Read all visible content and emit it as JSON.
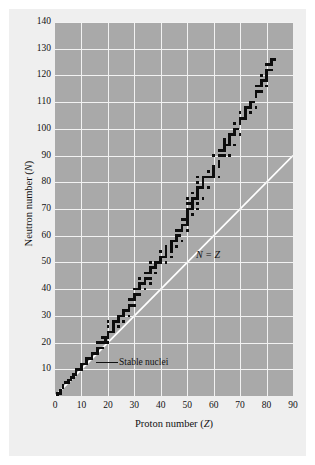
{
  "figure": {
    "background_color": "#efefef",
    "plot_background_color": "#a9a9a9",
    "grid_color": "#f2f2f2",
    "marker_color": "#0d0d0d",
    "reference_line_color": "#ffffff"
  },
  "axes": {
    "x_title_prefix": "Proton number (",
    "x_title_symbol": "Z",
    "x_title_suffix": ")",
    "y_title_prefix": "Neutron number (",
    "y_title_symbol": "N",
    "y_title_suffix": ")",
    "x_ticks": [
      "0",
      "10",
      "20",
      "30",
      "40",
      "50",
      "60",
      "70",
      "80",
      "90"
    ],
    "y_ticks": [
      "10",
      "20",
      "30",
      "40",
      "50",
      "60",
      "70",
      "80",
      "90",
      "100",
      "110",
      "120",
      "130",
      "140"
    ]
  },
  "annotations": {
    "nz_line_label": "N = Z",
    "stable_nuclei_label": "Stable nuclei"
  },
  "chart_data": {
    "type": "scatter",
    "title": "",
    "subtitle": "",
    "xlabel": "Proton number (Z)",
    "ylabel": "Neutron number (N)",
    "xlim": [
      0,
      90
    ],
    "ylim": [
      0,
      140
    ],
    "xticks": [
      0,
      10,
      20,
      30,
      40,
      50,
      60,
      70,
      80,
      90
    ],
    "yticks": [
      0,
      10,
      20,
      30,
      40,
      50,
      60,
      70,
      80,
      90,
      100,
      110,
      120,
      130,
      140
    ],
    "grid": true,
    "legend": "none",
    "annotations": [
      {
        "text": "N = Z",
        "x": 57,
        "y": 49
      },
      {
        "text": "Stable nuclei",
        "x": 24,
        "y": 14
      }
    ],
    "reference_lines": [
      {
        "name": "N = Z",
        "type": "line",
        "color": "#ffffff",
        "points": [
          [
            0,
            0
          ],
          [
            90,
            90
          ]
        ]
      }
    ],
    "series": [
      {
        "name": "Stable nuclei",
        "marker": "square",
        "color": "#0d0d0d",
        "description": "Z (proton number) and N (neutron number) of the stable nuclides (band of stability)",
        "points": [
          [
            1,
            0
          ],
          [
            1,
            1
          ],
          [
            2,
            1
          ],
          [
            2,
            2
          ],
          [
            3,
            3
          ],
          [
            3,
            4
          ],
          [
            4,
            5
          ],
          [
            5,
            5
          ],
          [
            5,
            6
          ],
          [
            6,
            6
          ],
          [
            6,
            7
          ],
          [
            7,
            7
          ],
          [
            7,
            8
          ],
          [
            8,
            8
          ],
          [
            8,
            9
          ],
          [
            8,
            10
          ],
          [
            9,
            10
          ],
          [
            10,
            10
          ],
          [
            10,
            11
          ],
          [
            10,
            12
          ],
          [
            11,
            12
          ],
          [
            12,
            12
          ],
          [
            12,
            13
          ],
          [
            12,
            14
          ],
          [
            13,
            14
          ],
          [
            14,
            14
          ],
          [
            14,
            15
          ],
          [
            14,
            16
          ],
          [
            15,
            16
          ],
          [
            16,
            16
          ],
          [
            16,
            17
          ],
          [
            16,
            18
          ],
          [
            16,
            20
          ],
          [
            17,
            18
          ],
          [
            17,
            20
          ],
          [
            18,
            18
          ],
          [
            18,
            20
          ],
          [
            18,
            22
          ],
          [
            19,
            20
          ],
          [
            19,
            21
          ],
          [
            19,
            22
          ],
          [
            20,
            20
          ],
          [
            20,
            22
          ],
          [
            20,
            23
          ],
          [
            20,
            24
          ],
          [
            20,
            26
          ],
          [
            20,
            28
          ],
          [
            21,
            24
          ],
          [
            22,
            24
          ],
          [
            22,
            25
          ],
          [
            22,
            26
          ],
          [
            22,
            27
          ],
          [
            22,
            28
          ],
          [
            23,
            28
          ],
          [
            24,
            26
          ],
          [
            24,
            28
          ],
          [
            24,
            29
          ],
          [
            24,
            30
          ],
          [
            25,
            30
          ],
          [
            26,
            28
          ],
          [
            26,
            30
          ],
          [
            26,
            31
          ],
          [
            26,
            32
          ],
          [
            27,
            32
          ],
          [
            28,
            30
          ],
          [
            28,
            32
          ],
          [
            28,
            33
          ],
          [
            28,
            34
          ],
          [
            28,
            36
          ],
          [
            29,
            34
          ],
          [
            29,
            36
          ],
          [
            30,
            34
          ],
          [
            30,
            36
          ],
          [
            30,
            37
          ],
          [
            30,
            38
          ],
          [
            30,
            40
          ],
          [
            31,
            38
          ],
          [
            31,
            40
          ],
          [
            32,
            38
          ],
          [
            32,
            40
          ],
          [
            32,
            41
          ],
          [
            32,
            42
          ],
          [
            32,
            44
          ],
          [
            33,
            42
          ],
          [
            34,
            40
          ],
          [
            34,
            42
          ],
          [
            34,
            43
          ],
          [
            34,
            44
          ],
          [
            34,
            46
          ],
          [
            35,
            44
          ],
          [
            35,
            46
          ],
          [
            36,
            42
          ],
          [
            36,
            44
          ],
          [
            36,
            46
          ],
          [
            36,
            47
          ],
          [
            36,
            48
          ],
          [
            36,
            50
          ],
          [
            37,
            48
          ],
          [
            38,
            46
          ],
          [
            38,
            48
          ],
          [
            38,
            49
          ],
          [
            38,
            50
          ],
          [
            39,
            50
          ],
          [
            40,
            50
          ],
          [
            40,
            51
          ],
          [
            40,
            52
          ],
          [
            40,
            54
          ],
          [
            41,
            52
          ],
          [
            42,
            50
          ],
          [
            42,
            52
          ],
          [
            42,
            53
          ],
          [
            42,
            54
          ],
          [
            42,
            55
          ],
          [
            42,
            56
          ],
          [
            44,
            52
          ],
          [
            44,
            54
          ],
          [
            44,
            55
          ],
          [
            44,
            56
          ],
          [
            44,
            57
          ],
          [
            44,
            58
          ],
          [
            45,
            58
          ],
          [
            46,
            56
          ],
          [
            46,
            58
          ],
          [
            46,
            59
          ],
          [
            46,
            60
          ],
          [
            46,
            62
          ],
          [
            47,
            60
          ],
          [
            47,
            62
          ],
          [
            48,
            58
          ],
          [
            48,
            62
          ],
          [
            48,
            63
          ],
          [
            48,
            64
          ],
          [
            48,
            66
          ],
          [
            49,
            64
          ],
          [
            49,
            66
          ],
          [
            50,
            62
          ],
          [
            50,
            64
          ],
          [
            50,
            65
          ],
          [
            50,
            66
          ],
          [
            50,
            67
          ],
          [
            50,
            68
          ],
          [
            50,
            69
          ],
          [
            50,
            70
          ],
          [
            50,
            72
          ],
          [
            50,
            74
          ],
          [
            51,
            70
          ],
          [
            51,
            72
          ],
          [
            52,
            68
          ],
          [
            52,
            70
          ],
          [
            52,
            71
          ],
          [
            52,
            72
          ],
          [
            52,
            73
          ],
          [
            52,
            74
          ],
          [
            52,
            76
          ],
          [
            53,
            74
          ],
          [
            54,
            70
          ],
          [
            54,
            72
          ],
          [
            54,
            74
          ],
          [
            54,
            75
          ],
          [
            54,
            76
          ],
          [
            54,
            77
          ],
          [
            54,
            78
          ],
          [
            54,
            80
          ],
          [
            54,
            82
          ],
          [
            55,
            78
          ],
          [
            56,
            74
          ],
          [
            56,
            78
          ],
          [
            56,
            79
          ],
          [
            56,
            80
          ],
          [
            56,
            81
          ],
          [
            56,
            82
          ],
          [
            57,
            82
          ],
          [
            58,
            78
          ],
          [
            58,
            82
          ],
          [
            58,
            84
          ],
          [
            59,
            82
          ],
          [
            60,
            82
          ],
          [
            60,
            83
          ],
          [
            60,
            84
          ],
          [
            60,
            85
          ],
          [
            60,
            86
          ],
          [
            60,
            90
          ],
          [
            62,
            82
          ],
          [
            62,
            86
          ],
          [
            62,
            87
          ],
          [
            62,
            88
          ],
          [
            62,
            90
          ],
          [
            62,
            92
          ],
          [
            63,
            90
          ],
          [
            63,
            92
          ],
          [
            64,
            90
          ],
          [
            64,
            92
          ],
          [
            64,
            93
          ],
          [
            64,
            94
          ],
          [
            64,
            95
          ],
          [
            64,
            96
          ],
          [
            65,
            94
          ],
          [
            66,
            90
          ],
          [
            66,
            94
          ],
          [
            66,
            95
          ],
          [
            66,
            96
          ],
          [
            66,
            97
          ],
          [
            66,
            98
          ],
          [
            67,
            98
          ],
          [
            68,
            94
          ],
          [
            68,
            98
          ],
          [
            68,
            99
          ],
          [
            68,
            100
          ],
          [
            68,
            102
          ],
          [
            69,
            100
          ],
          [
            70,
            98
          ],
          [
            70,
            102
          ],
          [
            70,
            103
          ],
          [
            70,
            104
          ],
          [
            70,
            106
          ],
          [
            71,
            104
          ],
          [
            72,
            104
          ],
          [
            72,
            105
          ],
          [
            72,
            106
          ],
          [
            72,
            107
          ],
          [
            72,
            108
          ],
          [
            73,
            108
          ],
          [
            74,
            106
          ],
          [
            74,
            108
          ],
          [
            74,
            109
          ],
          [
            74,
            110
          ],
          [
            75,
            110
          ],
          [
            76,
            108
          ],
          [
            76,
            112
          ],
          [
            76,
            113
          ],
          [
            76,
            114
          ],
          [
            76,
            116
          ],
          [
            77,
            114
          ],
          [
            77,
            116
          ],
          [
            78,
            114
          ],
          [
            78,
            116
          ],
          [
            78,
            117
          ],
          [
            78,
            118
          ],
          [
            78,
            120
          ],
          [
            79,
            118
          ],
          [
            80,
            116
          ],
          [
            80,
            118
          ],
          [
            80,
            119
          ],
          [
            80,
            120
          ],
          [
            80,
            121
          ],
          [
            80,
            122
          ],
          [
            80,
            124
          ],
          [
            81,
            122
          ],
          [
            81,
            124
          ],
          [
            82,
            122
          ],
          [
            82,
            124
          ],
          [
            82,
            125
          ],
          [
            82,
            126
          ],
          [
            83,
            126
          ]
        ]
      }
    ]
  }
}
